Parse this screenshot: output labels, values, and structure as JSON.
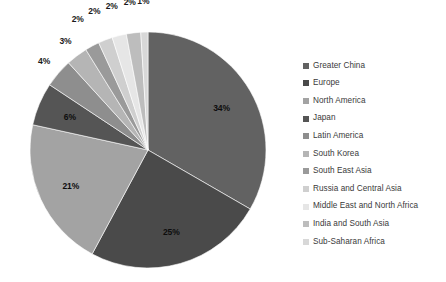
{
  "chart_data": {
    "type": "pie",
    "title": "",
    "subtitle": "",
    "xlabel": "",
    "ylabel": "",
    "grid": false,
    "legend_position": "right",
    "start_angle_deg": 0,
    "direction": "clockwise",
    "categories": [
      "Greater China",
      "Europe",
      "North America",
      "Japan",
      "Latin America",
      "South Korea",
      "South East Asia",
      "Russia and Central Asia",
      "Middle East and North Africa",
      "India and South Asia",
      "Sub-Saharan Africa"
    ],
    "values": [
      34,
      25,
      21,
      6,
      4,
      3,
      2,
      2,
      2,
      2,
      1
    ],
    "data_labels": [
      "34%",
      "25%",
      "21%",
      "6%",
      "4%",
      "3%",
      "2%",
      "2%",
      "2%",
      "2%",
      "1%"
    ],
    "colors": [
      "#626262",
      "#4a4a4a",
      "#a3a3a3",
      "#555555",
      "#8e8e8e",
      "#b5b5b5",
      "#9a9a9a",
      "#cfcfcf",
      "#e6e6e6",
      "#bdbdbd",
      "#d8d8d8"
    ]
  },
  "legend": {
    "items": [
      {
        "label": "Greater China",
        "color": "#626262"
      },
      {
        "label": "Europe",
        "color": "#4a4a4a"
      },
      {
        "label": "North America",
        "color": "#a3a3a3"
      },
      {
        "label": "Japan",
        "color": "#555555"
      },
      {
        "label": "Latin America",
        "color": "#8e8e8e"
      },
      {
        "label": "South Korea",
        "color": "#b5b5b5"
      },
      {
        "label": "South East Asia",
        "color": "#9a9a9a"
      },
      {
        "label": "Russia and Central Asia",
        "color": "#cfcfcf"
      },
      {
        "label": "Middle East and North Africa",
        "color": "#e6e6e6"
      },
      {
        "label": "India and South Asia",
        "color": "#bdbdbd"
      },
      {
        "label": "Sub-Saharan Africa",
        "color": "#d8d8d8"
      }
    ]
  },
  "geometry": {
    "center_x": 130,
    "center_y": 142,
    "radius": 118
  }
}
